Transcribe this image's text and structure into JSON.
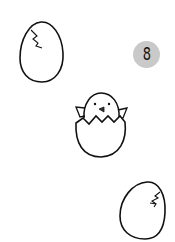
{
  "page": {
    "background": "#ffffff",
    "badge": {
      "label": "8",
      "color": "#c9c9c9"
    },
    "illustrations": [
      {
        "name": "cracked-egg",
        "position": "top-left"
      },
      {
        "name": "hatching-chick",
        "position": "center"
      },
      {
        "name": "cracked-egg",
        "position": "bottom-right"
      }
    ]
  }
}
